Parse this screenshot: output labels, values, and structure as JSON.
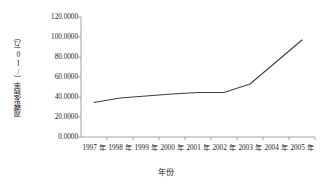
{
  "chart_data": {
    "type": "line",
    "title": "",
    "xlabel": "年份",
    "ylabel": "观察发病率（/10万）",
    "categories": [
      "1997 年",
      "1998 年",
      "1999 年",
      "2000 年",
      "2001 年",
      "2002 年",
      "2003 年",
      "2004 年",
      "2005 年"
    ],
    "x": [
      1997,
      1998,
      1999,
      2000,
      2001,
      2002,
      2003,
      2004,
      2005
    ],
    "values": [
      34.5,
      39.0,
      41.0,
      43.0,
      44.5,
      44.5,
      53.0,
      75.0,
      97.0
    ],
    "series": [
      {
        "name": "观察发病率",
        "values": [
          34.5,
          39.0,
          41.0,
          43.0,
          44.5,
          44.5,
          53.0,
          75.0,
          97.0
        ]
      }
    ],
    "ylim": [
      0,
      120
    ],
    "yticks": [
      0,
      20,
      40,
      60,
      80,
      100,
      120
    ],
    "ytick_labels": [
      "0.0000",
      "20.0000",
      "40.0000",
      "60.0000",
      "80.0000",
      "100.0000",
      "120.0000"
    ],
    "grid": false,
    "legend": "none",
    "line_color": "#404040",
    "axis_color": "#a0a0a0"
  }
}
